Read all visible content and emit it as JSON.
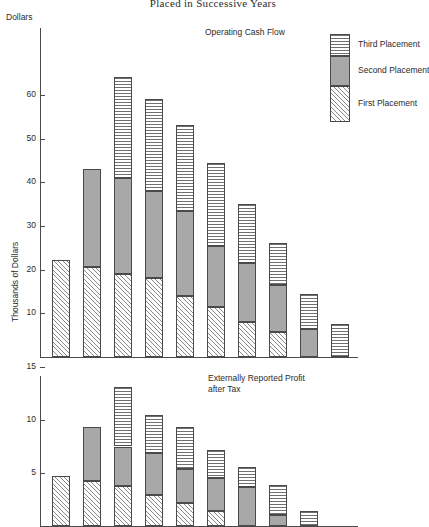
{
  "figure": {
    "title": "Placed in Successive Years",
    "legend": [
      {
        "key": "third",
        "label": "Third Placement"
      },
      {
        "key": "second",
        "label": "Second Placement"
      },
      {
        "key": "first",
        "label": "First Placement"
      }
    ]
  },
  "chart_data": [
    {
      "type": "bar",
      "stacked": true,
      "title": "Operating Cash Flow",
      "xlabel": "",
      "ylabel": "Thousands of Dollars",
      "y_unit_label": "Dollars",
      "ylim": [
        0,
        66
      ],
      "yticks": [
        10,
        20,
        30,
        40,
        50,
        60
      ],
      "ytick_labels": [
        "10",
        "20",
        "30",
        "40",
        "50",
        "60"
      ],
      "grid": false,
      "categories": [
        "1",
        "2",
        "3",
        "4",
        "5",
        "6",
        "7",
        "8",
        "9",
        "10"
      ],
      "series": [
        {
          "name": "First Placement",
          "values": [
            22.3,
            20.6,
            19.0,
            18.0,
            14.0,
            11.5,
            8.0,
            5.8,
            0.0,
            0.0
          ]
        },
        {
          "name": "Second Placement",
          "values": [
            0.0,
            22.4,
            22.0,
            20.0,
            19.5,
            14.0,
            13.5,
            10.7,
            6.5,
            0.0
          ]
        },
        {
          "name": "Third Placement",
          "values": [
            0.0,
            0.0,
            23.0,
            21.0,
            19.5,
            18.8,
            13.5,
            9.5,
            8.0,
            7.5
          ]
        }
      ],
      "totals": [
        22.3,
        43.0,
        64.0,
        59.0,
        53.0,
        44.3,
        35.0,
        26.0,
        14.5,
        7.5
      ]
    },
    {
      "type": "bar",
      "stacked": true,
      "title": "Externally Reported Profit\nafter Tax",
      "xlabel": "",
      "ylabel": "",
      "ylim": [
        0,
        16
      ],
      "yticks": [
        5,
        10,
        15
      ],
      "ytick_labels": [
        "5",
        "10",
        "15"
      ],
      "grid": false,
      "categories": [
        "1",
        "2",
        "3",
        "4",
        "5",
        "6",
        "7",
        "8",
        "9"
      ],
      "series": [
        {
          "name": "First Placement",
          "values": [
            4.7,
            4.2,
            3.8,
            2.9,
            2.2,
            1.4,
            0.0,
            0.0,
            0.0
          ]
        },
        {
          "name": "Second Placement",
          "values": [
            0.0,
            5.1,
            3.7,
            4.0,
            3.2,
            3.1,
            3.7,
            1.0,
            0.0
          ]
        },
        {
          "name": "Third Placement",
          "values": [
            0.0,
            0.0,
            5.6,
            3.6,
            3.9,
            2.7,
            1.9,
            2.9,
            1.4
          ]
        }
      ],
      "totals": [
        4.7,
        9.3,
        13.1,
        10.5,
        9.3,
        7.2,
        5.6,
        3.9,
        1.4
      ]
    }
  ]
}
